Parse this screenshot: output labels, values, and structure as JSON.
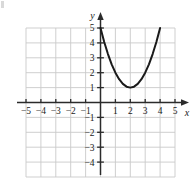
{
  "figure": {
    "kind": "cartesian-graph",
    "axis_label_x": "x",
    "axis_label_y": "y",
    "colors": {
      "curve": "#1a1a1a",
      "axis": "#2b2b2b",
      "grid": "#c9c9c9",
      "tick_label": "#1a1a1a",
      "background": "#ffffff"
    }
  },
  "chart_data": {
    "type": "line",
    "title": "",
    "xlabel": "x",
    "ylabel": "y",
    "xlim": [
      -5,
      5
    ],
    "ylim": [
      -5,
      5
    ],
    "grid": true,
    "legend": "none",
    "xticks": [
      -5,
      -4,
      -3,
      -2,
      -1,
      1,
      2,
      3,
      4,
      5
    ],
    "yticks": [
      5,
      4,
      3,
      2,
      1,
      -1,
      -2,
      -3,
      -4
    ],
    "xtick_labels": [
      "-5",
      "-4",
      "-3",
      "-2",
      "-1",
      "1",
      "2",
      "3",
      "4",
      "5"
    ],
    "ytick_labels": [
      "5",
      "4",
      "3",
      "2",
      "1",
      "-1",
      "-2",
      "-3",
      "-4"
    ],
    "series": [
      {
        "name": "parabola",
        "equation": "y = (x - 2)^2 + 1",
        "vertex": [
          2,
          1
        ],
        "domain": [
          0,
          4
        ],
        "x": [
          0,
          0.25,
          0.5,
          0.75,
          1,
          1.25,
          1.5,
          1.75,
          2,
          2.25,
          2.5,
          2.75,
          3,
          3.25,
          3.5,
          3.75,
          4
        ],
        "values": [
          5,
          4.0625,
          3.25,
          2.5625,
          2,
          1.5625,
          1.25,
          1.0625,
          1,
          1.0625,
          1.25,
          1.5625,
          2,
          2.5625,
          3.25,
          4.0625,
          5
        ]
      }
    ]
  }
}
